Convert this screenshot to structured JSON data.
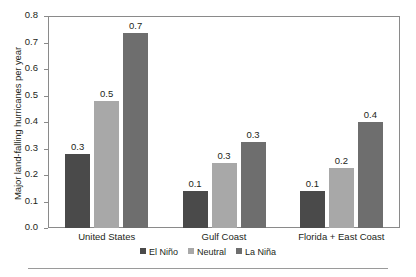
{
  "chart_data": {
    "type": "bar",
    "title": "",
    "xlabel": "",
    "ylabel": "Major land-falling hurricanes per year",
    "ylim": [
      0.0,
      0.8
    ],
    "ytick_labels": [
      "0.0",
      "0.1",
      "0.2",
      "0.3",
      "0.4",
      "0.5",
      "0.6",
      "0.7",
      "0.8"
    ],
    "ytick_values": [
      0.0,
      0.1,
      0.2,
      0.3,
      0.4,
      0.5,
      0.6,
      0.7,
      0.8
    ],
    "grid": false,
    "legend_position": "bottom-center",
    "categories": [
      "United States",
      "Gulf Coast",
      "Florida + East Coast"
    ],
    "series": [
      {
        "name": "El Niño",
        "color": "#4a4a4a",
        "values": [
          0.28,
          0.14,
          0.14
        ],
        "labels": [
          "0.3",
          "0.1",
          "0.1"
        ]
      },
      {
        "name": "Neutral",
        "color": "#a8a8a8",
        "values": [
          0.48,
          0.245,
          0.225
        ],
        "labels": [
          "0.5",
          "0.3",
          "0.2"
        ]
      },
      {
        "name": "La Niña",
        "color": "#6e6e6e",
        "values": [
          0.735,
          0.325,
          0.4
        ],
        "labels": [
          "0.7",
          "0.3",
          "0.4"
        ]
      }
    ]
  },
  "colors": {
    "el_nino": "#4a4a4a",
    "neutral": "#a8a8a8",
    "la_nina": "#6e6e6e",
    "axis": "#8a8a8a",
    "text": "#231f20",
    "rule": "#9a9a9a"
  }
}
